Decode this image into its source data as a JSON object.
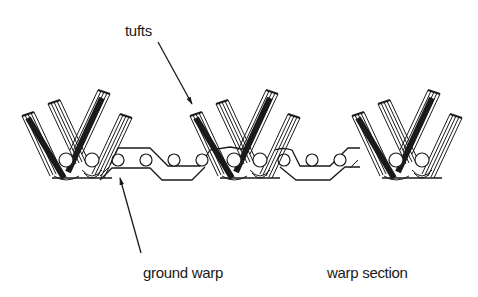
{
  "diagram": {
    "type": "textile cross-section",
    "labels": {
      "tufts": "tufts",
      "ground_warp": "ground warp",
      "warp_section": "warp section"
    },
    "colors": {
      "line": "#1a1a1a",
      "background": "#ffffff"
    },
    "tuft_groups": 3,
    "ground_warp_circles_per_repeat": 4
  }
}
